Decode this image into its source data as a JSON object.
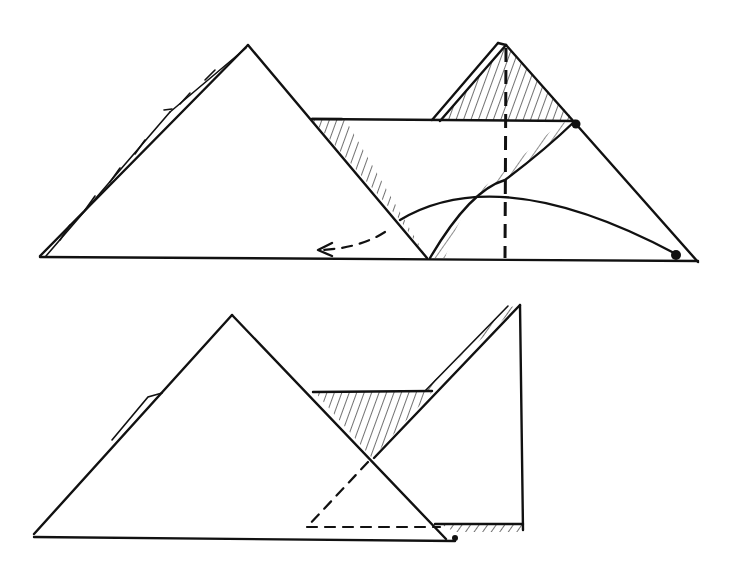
{
  "figure": {
    "colors": {
      "ink": "#111111",
      "paper": "#ffffff"
    },
    "steps": [
      {
        "id": "step-1",
        "elements": [
          "large-left-triangle",
          "right-triangle-with-vertical-valley-fold",
          "horizontal-band",
          "curved-fold-arc",
          "dashed-fold-arrow-left",
          "pivot-dots"
        ]
      },
      {
        "id": "step-2",
        "elements": [
          "large-left-triangle",
          "folded-right-flap",
          "hatched-inner-triangle",
          "dashed-hidden-edges"
        ]
      }
    ]
  }
}
